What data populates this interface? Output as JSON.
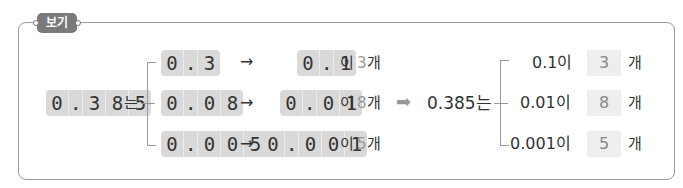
{
  "header": {
    "tag_label": "보기"
  },
  "left": {
    "number_cells": [
      "0",
      ".",
      "3",
      "8",
      "5"
    ],
    "suffix": "는",
    "rows": [
      {
        "part_cells": [
          "0",
          ".",
          "3"
        ],
        "arrow": "→",
        "unit_cells": [
          "0",
          ".",
          "1"
        ],
        "josa": "이",
        "count": "3",
        "unit": "개"
      },
      {
        "part_cells": [
          "0",
          ".",
          "0",
          "8"
        ],
        "arrow": "→",
        "unit_cells": [
          "0",
          ".",
          "0",
          "1"
        ],
        "josa": "이",
        "count": "8",
        "unit": "개"
      },
      {
        "part_cells": [
          "0",
          ".",
          "0",
          "0",
          "5"
        ],
        "arrow": "→",
        "unit_cells": [
          "0",
          ".",
          "0",
          "0",
          "1"
        ],
        "josa": "이",
        "count": "5",
        "unit": "개"
      }
    ]
  },
  "transition_arrow": "➡",
  "right": {
    "number_label": "0.385는",
    "rows": [
      {
        "unit_label": "0.1이",
        "count": "3",
        "unit": "개"
      },
      {
        "unit_label": "0.01이",
        "count": "8",
        "unit": "개"
      },
      {
        "unit_label": "0.001이",
        "count": "5",
        "unit": "개"
      }
    ]
  },
  "colors": {
    "tag_bg": "#7a7a7a",
    "cell_bg": "#d9d9d9",
    "answer_bg": "#eeeeee",
    "frame": "#9a9a9a"
  }
}
